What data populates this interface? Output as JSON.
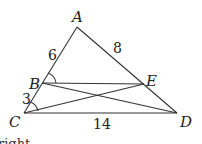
{
  "diagram": {
    "type": "geometry-triangle",
    "points": {
      "A": {
        "label": "A",
        "x": 77,
        "y": 27,
        "lx": 73,
        "ly": 22
      },
      "B": {
        "label": "B",
        "x": 42,
        "y": 83,
        "lx": 28,
        "ly": 88
      },
      "C": {
        "label": "C",
        "x": 24,
        "y": 113,
        "lx": 9,
        "ly": 127
      },
      "D": {
        "label": "D",
        "x": 177,
        "y": 113,
        "lx": 180,
        "ly": 128
      },
      "E": {
        "label": "E",
        "x": 144,
        "y": 84,
        "lx": 146,
        "ly": 84
      }
    },
    "segments": [
      "AC",
      "AD",
      "CD",
      "BE",
      "BD",
      "CE"
    ],
    "lengths": {
      "AB": "6",
      "AE": "8",
      "BC": "3",
      "CD": "14"
    },
    "angle_marks": [
      "ABE",
      "ACD"
    ],
    "footer_text": "right"
  }
}
